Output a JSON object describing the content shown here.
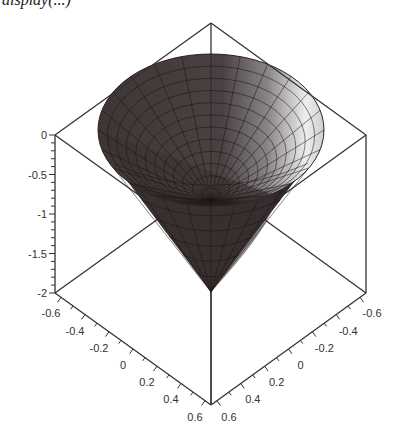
{
  "caption": "display(...)",
  "chart_data": {
    "type": "surface3d",
    "title": "",
    "surface": "cone",
    "apex": {
      "x": 0,
      "y": 0,
      "z": -2
    },
    "rim": {
      "z": 0,
      "radius": 0.5
    },
    "x_axis": {
      "label": "",
      "range": [
        -0.65,
        0.65
      ],
      "ticks": [
        "-0.6",
        "-0.4",
        "-0.2",
        "0",
        "0.2",
        "0.4",
        "0.6"
      ]
    },
    "y_axis": {
      "label": "",
      "range": [
        -0.65,
        0.65
      ],
      "ticks": [
        "-0.6",
        "-0.4",
        "-0.2",
        "0",
        "0.2",
        "0.4",
        "0.6"
      ]
    },
    "z_axis": {
      "label": "",
      "range": [
        -2,
        0
      ],
      "ticks": [
        "0",
        "-0.5",
        "-1",
        "-1.5",
        "-2"
      ]
    },
    "axes_style": "boxed",
    "colors": {
      "surface_dark": "#3a3232",
      "surface_light": "#f2f2f2",
      "mesh": "#1a1414",
      "frame": "#333333"
    }
  }
}
